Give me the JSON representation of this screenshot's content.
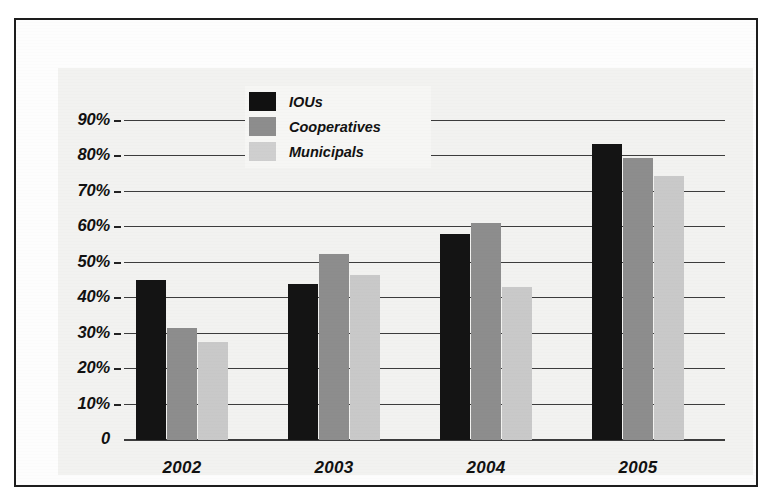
{
  "chart_data": {
    "type": "bar",
    "title": "",
    "xlabel": "",
    "ylabel": "",
    "categories": [
      "2002",
      "2003",
      "2004",
      "2005"
    ],
    "series": [
      {
        "name": "IOUs",
        "color": "#141414",
        "values": [
          45.0,
          44.0,
          58.0,
          83.5
        ]
      },
      {
        "name": "Cooperatives",
        "color": "#8d8d8d",
        "values": [
          31.5,
          52.5,
          61.0,
          79.5
        ]
      },
      {
        "name": "Municipals",
        "color": "#c9c9c9",
        "values": [
          27.5,
          46.5,
          43.0,
          74.5
        ]
      }
    ],
    "ylim": [
      0,
      95
    ],
    "yticks": [
      "0",
      "10%",
      "20%",
      "30%",
      "40%",
      "50%",
      "60%",
      "70%",
      "80%",
      "90%"
    ],
    "ytick_values": [
      0,
      10,
      20,
      30,
      40,
      50,
      60,
      70,
      80,
      90
    ],
    "grid": true,
    "legend_position": "top-center"
  },
  "legend": {
    "items": [
      {
        "label": "IOUs",
        "swatch": "black-swatch"
      },
      {
        "label": "Cooperatives",
        "swatch": "gray-swatch"
      },
      {
        "label": "Municipals",
        "swatch": "light-gray-swatch"
      }
    ]
  },
  "axis": {
    "y_labels": [
      "90%",
      "80%",
      "70%",
      "60%",
      "50%",
      "40%",
      "30%",
      "20%",
      "10%",
      "0"
    ],
    "x_labels": [
      "2002",
      "2003",
      "2004",
      "2005"
    ]
  },
  "colors": {
    "iou": "#141414",
    "cooperatives": "#8d8d8d",
    "municipals": "#c9c9c9",
    "panel_background": "#f2f2f0",
    "frame": "#1d1d1d",
    "gridline": "#3c3c3c"
  }
}
